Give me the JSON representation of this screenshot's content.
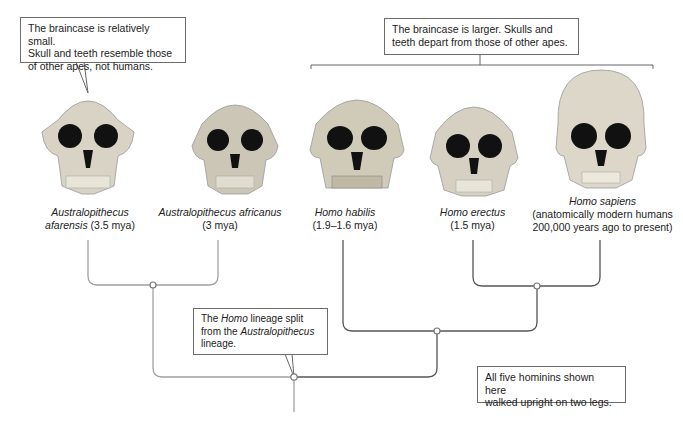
{
  "callouts": {
    "australopithecus": {
      "line1": "The braincase is relatively small.",
      "line2": "Skull and teeth resemble those",
      "line3": "of other apes, not humans."
    },
    "homo": {
      "line1": "The braincase is larger. Skulls and",
      "line2": "teeth depart from those of other apes."
    },
    "split": {
      "pre": "The ",
      "italic1": "Homo",
      "mid": " lineage split",
      "line2_pre": "from the ",
      "italic2": "Australopithecus",
      "line3": "lineage."
    },
    "bipedal": {
      "line1": "All five hominins shown here",
      "line2": "walked upright on two legs."
    }
  },
  "species": [
    {
      "genus_species": "Australopithecus",
      "line2_italic": "afarensis",
      "line2_rest": " (3.5 mya)"
    },
    {
      "genus_species": "Australopithecus africanus",
      "line2_rest": "(3 mya)"
    },
    {
      "genus_species": "Homo habilis",
      "line2_rest": "(1.9–1.6 mya)"
    },
    {
      "genus_species": "Homo erectus",
      "line2_rest": "(1.5 mya)"
    },
    {
      "genus_species": "Homo sapiens",
      "line2_rest": "(anatomically modern humans",
      "line3": "200,000 years ago to present)"
    }
  ],
  "colors": {
    "line_light": "#9a9a9a",
    "line_dark": "#555555",
    "bone": "#d9d4c6",
    "socket": "#111111"
  }
}
